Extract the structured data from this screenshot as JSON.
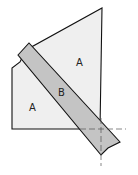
{
  "diagram": {
    "regions": [
      {
        "id": "A_upper",
        "label": "A",
        "x": 79,
        "y": 66
      },
      {
        "id": "A_lower",
        "label": "A",
        "x": 32,
        "y": 109
      },
      {
        "id": "B",
        "label": "B",
        "x": 62,
        "y": 94
      }
    ],
    "colors": {
      "region_a": "#efefef",
      "band_b": "#c4c4c4",
      "stroke": "#111111",
      "guide": "#555555"
    }
  }
}
